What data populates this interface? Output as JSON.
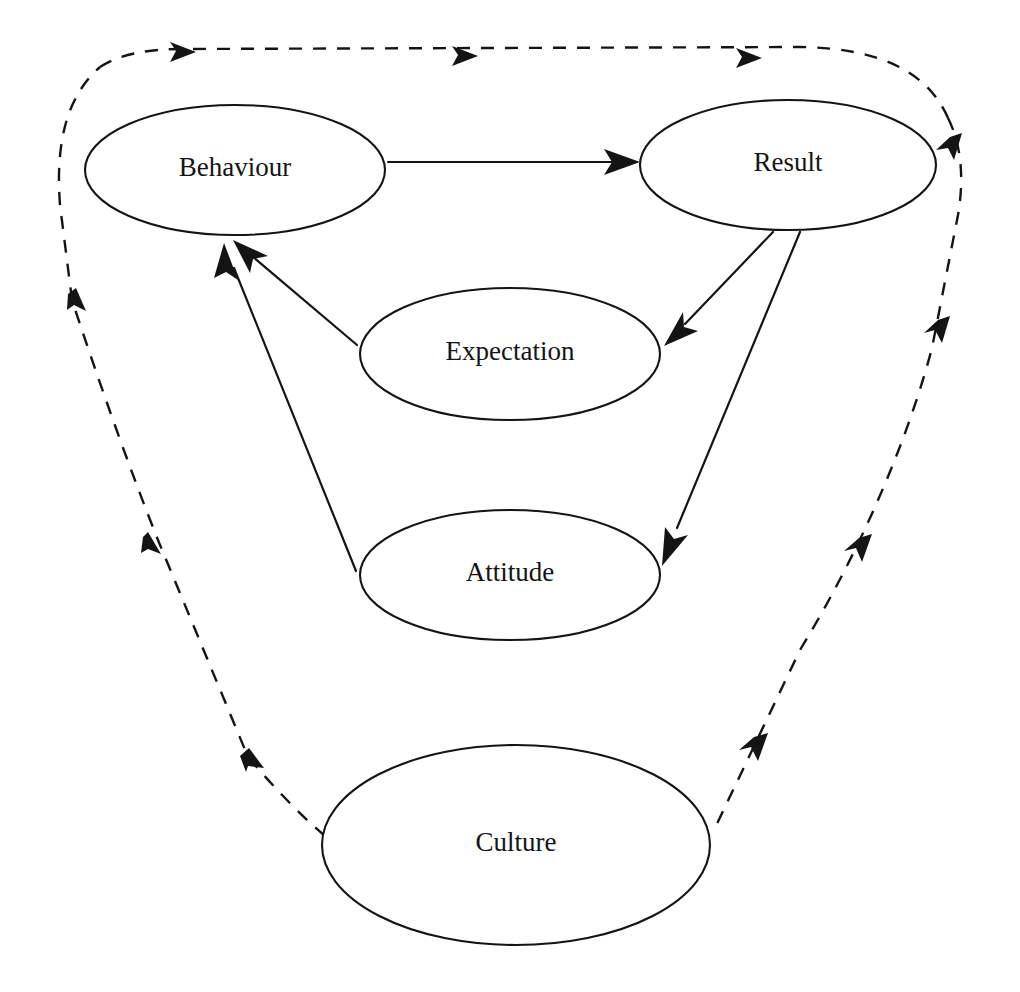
{
  "diagram": {
    "background_color": "#ffffff",
    "stroke_color": "#141414",
    "nodes": [
      {
        "id": "behaviour",
        "label": "Behaviour",
        "cx": 235,
        "cy": 170,
        "rx": 150,
        "ry": 65
      },
      {
        "id": "result",
        "label": "Result",
        "cx": 788,
        "cy": 165,
        "rx": 148,
        "ry": 65
      },
      {
        "id": "expectation",
        "label": "Expectation",
        "cx": 510,
        "cy": 354,
        "rx": 150,
        "ry": 66
      },
      {
        "id": "attitude",
        "label": "Attitude",
        "cx": 510,
        "cy": 575,
        "rx": 150,
        "ry": 65
      },
      {
        "id": "culture",
        "label": "Culture",
        "cx": 516,
        "cy": 845,
        "rx": 194,
        "ry": 100
      }
    ],
    "edges": [
      {
        "id": "behaviour-to-result",
        "from": "Behaviour",
        "to": "Result",
        "style": "solid",
        "arrow": "single"
      },
      {
        "id": "result-to-expectation",
        "from": "Result",
        "to": "Expectation",
        "style": "solid",
        "arrow": "single"
      },
      {
        "id": "result-to-attitude",
        "from": "Result",
        "to": "Attitude",
        "style": "solid",
        "arrow": "single"
      },
      {
        "id": "expectation-to-behaviour",
        "from": "Expectation",
        "to": "Behaviour",
        "style": "solid",
        "arrow": "single"
      },
      {
        "id": "attitude-to-behaviour",
        "from": "Attitude",
        "to": "Behaviour",
        "style": "solid",
        "arrow": "single"
      },
      {
        "id": "culture-to-behaviour",
        "from": "Culture",
        "to": "Behaviour",
        "style": "dashed",
        "arrow": "single"
      },
      {
        "id": "behaviour-to-result-outer",
        "from": "Behaviour",
        "to": "Result",
        "style": "dashed",
        "arrow": "single"
      },
      {
        "id": "result-to-culture",
        "from": "Result",
        "to": "Culture",
        "style": "dashed",
        "arrow": "single"
      }
    ]
  }
}
